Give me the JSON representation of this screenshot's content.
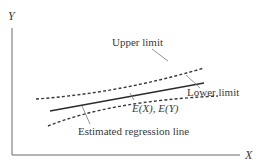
{
  "diagram": {
    "title": "",
    "axes": {
      "x_label": "X",
      "y_label": "Y"
    },
    "labels": {
      "upper_limit": "Upper limit",
      "lower_limit": "Lower limit",
      "mean_point": "E(X), E(Y)",
      "regression_line": "Estimated regression line"
    },
    "colors": {
      "line": "#2b2b2b",
      "dashed": "#3a3a3a",
      "axis": "#6b6b6b",
      "pointer": "#777777",
      "background": "#ffffff"
    }
  }
}
